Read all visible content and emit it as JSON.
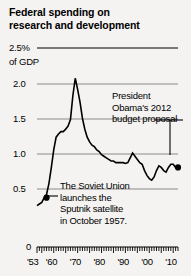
{
  "title": {
    "line1": "Federal spending on",
    "line2": "research and development"
  },
  "annotations": {
    "obama": {
      "line1": "President",
      "line2": "Obama's 2012",
      "line3": "budget proposal"
    },
    "sputnik": {
      "line1": "The Soviet Union",
      "line2": "launches the",
      "line3": "Sputnik satellite",
      "line4": "in October 1957."
    }
  },
  "chart_data": {
    "type": "line",
    "title": "Federal spending on research and development",
    "xlabel": "",
    "ylabel": "% of GDP",
    "ylim": [
      0,
      2.5
    ],
    "xlim": [
      1953,
      2012
    ],
    "grid": true,
    "legend": false,
    "yticks": [
      "2.5%",
      "2.0",
      "1.5",
      "1.0",
      "0.5",
      "0"
    ],
    "ytick_values": [
      2.5,
      2.0,
      1.5,
      1.0,
      0.5,
      0
    ],
    "ytick_suffix": "of GDP",
    "xticks": [
      "'53",
      "'60",
      "'70",
      "'80",
      "'90",
      "'00",
      "'10"
    ],
    "xtick_values": [
      1953,
      1960,
      1970,
      1980,
      1990,
      2000,
      2010
    ],
    "x": [
      1953,
      1954,
      1955,
      1956,
      1957,
      1958,
      1959,
      1960,
      1961,
      1962,
      1963,
      1964,
      1965,
      1966,
      1967,
      1968,
      1969,
      1970,
      1971,
      1972,
      1973,
      1974,
      1975,
      1976,
      1977,
      1978,
      1979,
      1980,
      1981,
      1982,
      1983,
      1984,
      1985,
      1986,
      1987,
      1988,
      1989,
      1990,
      1991,
      1992,
      1993,
      1994,
      1995,
      1996,
      1997,
      1998,
      1999,
      2000,
      2001,
      2002,
      2003,
      2004,
      2005,
      2006,
      2007,
      2008,
      2009,
      2010,
      2011,
      2012
    ],
    "values": [
      0.52,
      0.54,
      0.56,
      0.62,
      0.66,
      0.8,
      1.0,
      1.22,
      1.38,
      1.42,
      1.45,
      1.45,
      1.48,
      1.52,
      1.6,
      1.9,
      2.12,
      1.98,
      1.82,
      1.62,
      1.48,
      1.38,
      1.32,
      1.28,
      1.26,
      1.22,
      1.2,
      1.16,
      1.14,
      1.12,
      1.1,
      1.08,
      1.08,
      1.06,
      1.06,
      1.06,
      1.06,
      1.05,
      1.06,
      1.12,
      1.18,
      1.14,
      1.1,
      1.06,
      1.04,
      0.96,
      0.9,
      0.86,
      0.84,
      0.88,
      0.96,
      1.02,
      1.0,
      0.96,
      0.94,
      1.0,
      1.04,
      1.04,
      1.0,
      1.0
    ],
    "markers": [
      {
        "label": "Sputnik",
        "x": 1957,
        "y": 0.62
      },
      {
        "label": "Obama 2012 budget proposal",
        "x": 2012,
        "y": 1.0
      }
    ]
  }
}
